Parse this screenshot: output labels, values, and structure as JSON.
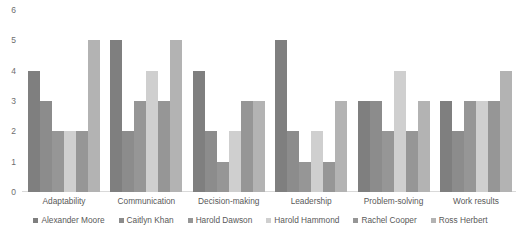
{
  "chart_data": {
    "type": "bar",
    "title": "",
    "xlabel": "",
    "ylabel": "",
    "ylim": [
      0,
      6
    ],
    "yticks": [
      "0",
      "1",
      "2",
      "3",
      "4",
      "5",
      "6"
    ],
    "grid": false,
    "legend_position": "bottom",
    "categories": [
      "Adaptability",
      "Communication",
      "Decision-making",
      "Leadership",
      "Problem-solving",
      "Work results"
    ],
    "series": [
      {
        "name": "Alexander Moore",
        "color": "#7f7f7f",
        "values": [
          4,
          5,
          4,
          5,
          3,
          3
        ]
      },
      {
        "name": "Caitlyn Khan",
        "color": "#8c8c8c",
        "values": [
          3,
          2,
          2,
          2,
          3,
          2
        ]
      },
      {
        "name": "Harold Dawson",
        "color": "#969696",
        "values": [
          2,
          3,
          1,
          1,
          2,
          3
        ]
      },
      {
        "name": "Harold Hammond",
        "color": "#cfcfcf",
        "values": [
          2,
          4,
          2,
          2,
          4,
          3
        ]
      },
      {
        "name": "Rachel Cooper",
        "color": "#969696",
        "values": [
          2,
          3,
          3,
          1,
          2,
          3
        ]
      },
      {
        "name": "Ross Herbert",
        "color": "#b3b3b3",
        "values": [
          5,
          5,
          3,
          3,
          3,
          4
        ]
      }
    ]
  }
}
